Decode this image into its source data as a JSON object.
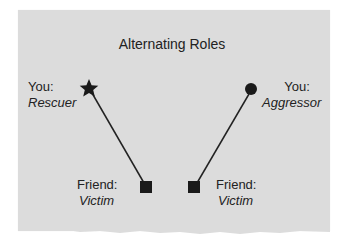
{
  "diagram": {
    "title": "Alternating Roles",
    "colors": {
      "background": "#dcdcdc",
      "ink": "#222222"
    },
    "nodes": [
      {
        "id": "you-left",
        "shape": "star-icon",
        "label_line1": "You:",
        "label_line2": "Rescuer"
      },
      {
        "id": "friend-left",
        "shape": "square-icon",
        "label_line1": "Friend:",
        "label_line2": "Victim"
      },
      {
        "id": "friend-right",
        "shape": "square-icon",
        "label_line1": "Friend:",
        "label_line2": "Victim"
      },
      {
        "id": "you-right",
        "shape": "circle-icon",
        "label_line1": "You:",
        "label_line2": "Aggressor"
      }
    ],
    "edges": [
      {
        "from": "you-left",
        "to": "friend-left"
      },
      {
        "from": "you-right",
        "to": "friend-right"
      }
    ]
  }
}
